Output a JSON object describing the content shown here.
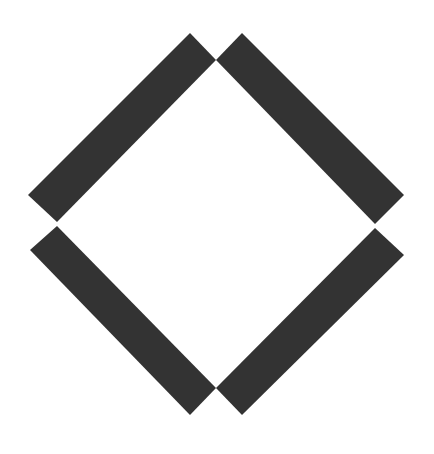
{
  "figure": {
    "colors": {
      "bar": "#333333",
      "background": "#ffffff"
    },
    "bars": [
      {
        "name": "top-left-bar"
      },
      {
        "name": "top-right-bar"
      },
      {
        "name": "bottom-left-bar"
      },
      {
        "name": "bottom-right-bar"
      }
    ]
  }
}
